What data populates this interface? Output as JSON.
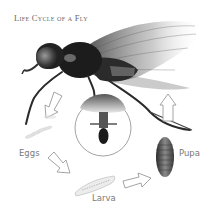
{
  "diagram": {
    "title": "Life Cycle of a Fly",
    "stages": [
      {
        "id": "adult",
        "label": ""
      },
      {
        "id": "eggs",
        "label": "Eggs"
      },
      {
        "id": "larva",
        "label": "Larva"
      },
      {
        "id": "pupa",
        "label": "Pupa"
      }
    ],
    "labels": {
      "eggs": "Eggs",
      "larva": "Larva",
      "pupa": "Pupa"
    },
    "arrows": [
      {
        "from": "adult",
        "to": "eggs",
        "direction": "down-left"
      },
      {
        "from": "eggs",
        "to": "larva",
        "direction": "down-right"
      },
      {
        "from": "larva",
        "to": "pupa",
        "direction": "right"
      },
      {
        "from": "pupa",
        "to": "adult",
        "direction": "up"
      }
    ],
    "inset": {
      "shape": "circle",
      "content": "fly-underside-mouthparts-closeup"
    },
    "colors": {
      "background": "#ffffff",
      "ink": "#1a1a1a",
      "arrow_stroke": "#9a9a9a",
      "label_text": "#7a7a7a"
    }
  }
}
